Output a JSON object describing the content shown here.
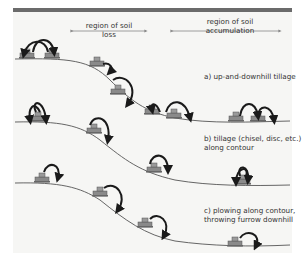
{
  "header": {
    "left_region_label": "region of soil loss",
    "right_region_label_line1": "region of soil",
    "right_region_label_line2": "accumulation"
  },
  "panels": [
    {
      "id": "a",
      "caption_line1": "a) up-and-downhill tillage",
      "caption_line2": ""
    },
    {
      "id": "b",
      "caption_line1": "b) tillage (chisel, disc, etc.)",
      "caption_line2": "along contour"
    },
    {
      "id": "c",
      "caption_line1": "c) plowing along contour,",
      "caption_line2": "throwing furrow downhill"
    }
  ],
  "colors": {
    "top_bar": "#6b6b6b",
    "background": "#f6f6f4",
    "ground_line": "#555555",
    "arrow": "#1a1a1a",
    "region_arrow": "#888888",
    "tractor": "#777777"
  }
}
